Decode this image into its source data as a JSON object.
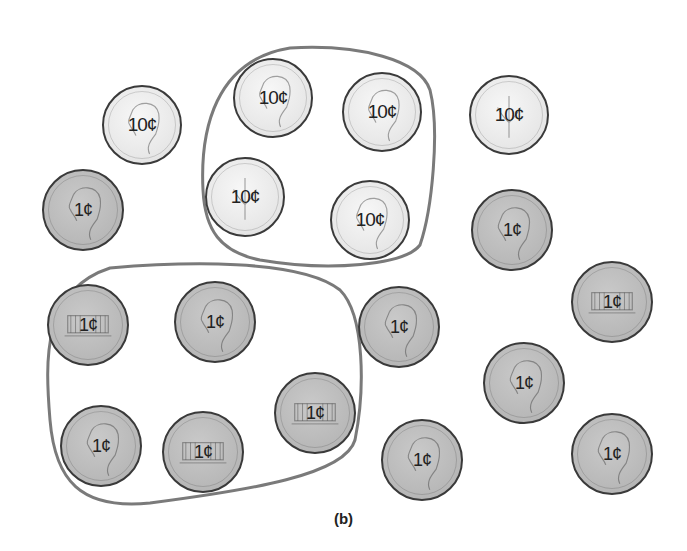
{
  "figure": {
    "caption": "(b)",
    "group_outline_color": "#7a7a7a",
    "dime_color": "#e8e8e8",
    "penny_color": "#b9b9b9"
  },
  "coins": [
    {
      "id": "dime-1",
      "type": "dime",
      "side": "heads",
      "label": "10¢",
      "x": 142,
      "y": 125,
      "d": 80,
      "grouped": false
    },
    {
      "id": "dime-2",
      "type": "dime",
      "side": "heads",
      "label": "10¢",
      "x": 273,
      "y": 98,
      "d": 80,
      "grouped": true,
      "group": 1
    },
    {
      "id": "dime-3",
      "type": "dime",
      "side": "heads",
      "label": "10¢",
      "x": 382,
      "y": 112,
      "d": 80,
      "grouped": true,
      "group": 1
    },
    {
      "id": "dime-4",
      "type": "dime",
      "side": "tails",
      "label": "10¢",
      "x": 245,
      "y": 197,
      "d": 80,
      "grouped": true,
      "group": 1
    },
    {
      "id": "dime-5",
      "type": "dime",
      "side": "heads",
      "label": "10¢",
      "x": 370,
      "y": 220,
      "d": 80,
      "grouped": true,
      "group": 1
    },
    {
      "id": "dime-6",
      "type": "dime",
      "side": "tails",
      "label": "10¢",
      "x": 509,
      "y": 115,
      "d": 80,
      "grouped": false
    },
    {
      "id": "penny-1",
      "type": "penny",
      "side": "heads",
      "label": "1¢",
      "x": 83,
      "y": 210,
      "d": 82,
      "grouped": false
    },
    {
      "id": "penny-2",
      "type": "penny",
      "side": "heads",
      "label": "1¢",
      "x": 512,
      "y": 230,
      "d": 82,
      "grouped": false
    },
    {
      "id": "penny-3",
      "type": "penny",
      "side": "tails",
      "label": "1¢",
      "x": 88,
      "y": 325,
      "d": 82,
      "grouped": true,
      "group": 2
    },
    {
      "id": "penny-4",
      "type": "penny",
      "side": "heads",
      "label": "1¢",
      "x": 215,
      "y": 322,
      "d": 82,
      "grouped": true,
      "group": 2
    },
    {
      "id": "penny-5",
      "type": "penny",
      "side": "heads",
      "label": "1¢",
      "x": 399,
      "y": 327,
      "d": 82,
      "grouped": false
    },
    {
      "id": "penny-6",
      "type": "penny",
      "side": "tails",
      "label": "1¢",
      "x": 612,
      "y": 302,
      "d": 82,
      "grouped": false
    },
    {
      "id": "penny-7",
      "type": "penny",
      "side": "tails",
      "label": "1¢",
      "x": 315,
      "y": 413,
      "d": 82,
      "grouped": true,
      "group": 2
    },
    {
      "id": "penny-8",
      "type": "penny",
      "side": "heads",
      "label": "1¢",
      "x": 524,
      "y": 383,
      "d": 82,
      "grouped": false
    },
    {
      "id": "penny-9",
      "type": "penny",
      "side": "heads",
      "label": "1¢",
      "x": 101,
      "y": 446,
      "d": 82,
      "grouped": true,
      "group": 2
    },
    {
      "id": "penny-10",
      "type": "penny",
      "side": "tails",
      "label": "1¢",
      "x": 203,
      "y": 452,
      "d": 82,
      "grouped": true,
      "group": 2
    },
    {
      "id": "penny-11",
      "type": "penny",
      "side": "heads",
      "label": "1¢",
      "x": 422,
      "y": 460,
      "d": 82,
      "grouped": false
    },
    {
      "id": "penny-12",
      "type": "penny",
      "side": "heads",
      "label": "1¢",
      "x": 612,
      "y": 454,
      "d": 82,
      "grouped": false
    }
  ],
  "groups": [
    {
      "id": 1,
      "label": "group of four dimes"
    },
    {
      "id": 2,
      "label": "group of six pennies"
    }
  ]
}
